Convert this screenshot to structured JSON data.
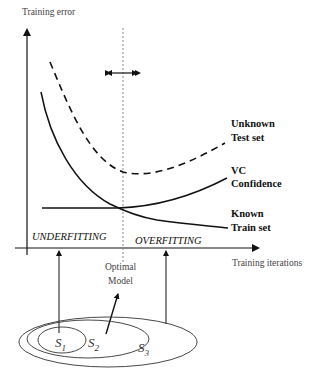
{
  "diagram": {
    "y_axis_label": "Training error",
    "x_axis_label": "Training iterations",
    "curves": [
      {
        "name": "Unknown Test set",
        "label_line1": "Unknown",
        "label_line2": "Test set",
        "style": "dashed"
      },
      {
        "name": "VC Confidence",
        "label_line1": "VC",
        "label_line2": "Confidence",
        "style": "solid"
      },
      {
        "name": "Known Train set",
        "label_line1": "Known",
        "label_line2": "Train set",
        "style": "solid"
      }
    ],
    "regions": {
      "left": "UNDERFITTING",
      "right": "OVERFITTING"
    },
    "optimal": {
      "line1": "Optimal",
      "line2": "Model"
    },
    "sets": [
      {
        "symbol": "S",
        "sub": "1"
      },
      {
        "symbol": "S",
        "sub": "2"
      },
      {
        "symbol": "S",
        "sub": "3"
      }
    ],
    "colors": {
      "line": "#111111",
      "guide": "#888888",
      "background": "#ffffff"
    }
  }
}
